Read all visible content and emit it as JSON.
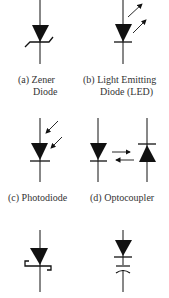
{
  "diagram": {
    "symbols": [
      {
        "id": "a",
        "name": "Zener Diode",
        "label_line1": "(a) Zener",
        "label_line2": "Diode"
      },
      {
        "id": "b",
        "name": "Light Emitting Diode",
        "label_line1": "(b) Light Emitting",
        "label_line2": "Diode (LED)"
      },
      {
        "id": "c",
        "name": "Photodiode",
        "label_line1": "(c) Photodiode"
      },
      {
        "id": "d",
        "name": "Optocoupler",
        "label_line1": "(d) Optocoupler"
      },
      {
        "id": "e",
        "name": "Schottky Diode"
      },
      {
        "id": "f",
        "name": "Varactor Diode"
      }
    ],
    "colors": {
      "stroke": "#111111",
      "fill": "#111111",
      "text": "#333333",
      "background": "#ffffff"
    }
  }
}
